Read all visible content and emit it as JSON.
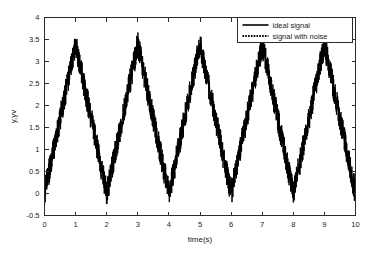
{
  "chart_data": {
    "type": "line",
    "title": "",
    "xlabel": "time(s)",
    "ylabel": "y,yv",
    "xlim": [
      0,
      10
    ],
    "ylim": [
      -0.5,
      4
    ],
    "grid": false,
    "legend_position": "top-right",
    "xticks": [
      "0",
      "1",
      "2",
      "3",
      "4",
      "5",
      "6",
      "7",
      "8",
      "9",
      "10"
    ],
    "xtick_values": [
      0,
      1,
      2,
      3,
      4,
      5,
      6,
      7,
      8,
      9,
      10
    ],
    "yticks": [
      "-0.5",
      "0",
      "0.5",
      "1",
      "1.5",
      "2",
      "2.5",
      "3",
      "3.5",
      "4"
    ],
    "ytick_values": [
      -0.5,
      0,
      0.5,
      1,
      1.5,
      2,
      2.5,
      3,
      3.5,
      4
    ],
    "series": [
      {
        "name": "ideal signal",
        "style": "solid",
        "color": "#000000",
        "description": "triangular waveform, period 2 s, baseline 0, peak 3.4, peaks at t = 1,3,5,7,9 and troughs at t = 0,2,4,6,8,10",
        "waveform": "triangle",
        "period": 2,
        "amplitude": 3.4,
        "offset": 0,
        "peak_times": [
          1,
          3,
          5,
          7,
          9
        ],
        "peak_values": [
          3.4,
          3.4,
          3.4,
          3.4,
          3.4
        ],
        "trough_times": [
          0,
          2,
          4,
          6,
          8,
          10
        ],
        "trough_values": [
          0,
          0,
          0,
          0,
          0,
          0
        ],
        "x": [
          0,
          1,
          2,
          3,
          4,
          5,
          6,
          7,
          8,
          9,
          10
        ],
        "values": [
          0,
          3.4,
          0,
          3.4,
          0,
          3.4,
          0,
          3.4,
          0,
          3.4,
          0
        ]
      },
      {
        "name": "signal with noise",
        "style": "dotted",
        "color": "#000000",
        "description": "same triangular waveform plus additive random noise of about plus/minus 0.3",
        "noise_amplitude": 0.3,
        "observed_max": 3.75,
        "observed_min": -0.35
      }
    ]
  },
  "legend": {
    "entries": [
      {
        "label": "ideal signal",
        "style": "solid"
      },
      {
        "label": "signal with noise",
        "style": "dotted"
      }
    ]
  },
  "axes": {
    "x_label": "time(s)",
    "y_label": "y,yv"
  }
}
